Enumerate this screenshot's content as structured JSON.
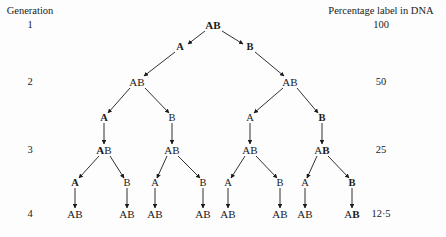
{
  "figure": {
    "background_color": "#fdfdfd",
    "ink_color": "#1a1a1a",
    "width": 446,
    "height": 237
  },
  "labels": {
    "generation_heading": "Generation",
    "percentage_heading": "Percentage label in DNA"
  },
  "generations": [
    {
      "number": "1",
      "percentage": "100"
    },
    {
      "number": "2",
      "percentage": "50"
    },
    {
      "number": "3",
      "percentage": "25"
    },
    {
      "number": "4",
      "percentage": "12·5"
    }
  ],
  "nodes": {
    "gen1": [
      {
        "id": "g1n1",
        "text": "AB",
        "bold_part": "AB",
        "plain_part": "",
        "x": 213,
        "y": 25
      }
    ],
    "gen2": [
      {
        "id": "g2n1",
        "text": "AB",
        "bold_part": "",
        "plain_part": "AB",
        "x": 137,
        "y": 82
      },
      {
        "id": "g2n2",
        "text": "AB",
        "bold_part": "",
        "plain_part": "AB",
        "x": 290,
        "y": 82
      }
    ],
    "gen3": [
      {
        "id": "g3n1",
        "text": "AB",
        "bold_part": "A",
        "plain_part": "B",
        "x": 104,
        "y": 150
      },
      {
        "id": "g3n2",
        "text": "AB",
        "bold_part": "",
        "plain_part": "AB",
        "x": 172,
        "y": 150
      },
      {
        "id": "g3n3",
        "text": "AB",
        "bold_part": "",
        "plain_part": "AB",
        "x": 250,
        "y": 150
      },
      {
        "id": "g3n4",
        "text": "AB",
        "bold_part": "B",
        "plain_part": "A",
        "x": 322,
        "y": 150
      }
    ],
    "gen4": [
      {
        "id": "g4n1",
        "text": "AB",
        "bold_part": "",
        "plain_part": "AB",
        "x": 75,
        "y": 214
      },
      {
        "id": "g4n2",
        "text": "AB",
        "bold_part": "",
        "plain_part": "AB",
        "x": 127,
        "y": 214
      },
      {
        "id": "g4n3",
        "text": "AB",
        "bold_part": "",
        "plain_part": "AB",
        "x": 155,
        "y": 214
      },
      {
        "id": "g4n4",
        "text": "AB",
        "bold_part": "",
        "plain_part": "AB",
        "x": 203,
        "y": 214
      },
      {
        "id": "g4n5",
        "text": "AB",
        "bold_part": "",
        "plain_part": "AB",
        "x": 228,
        "y": 214
      },
      {
        "id": "g4n6",
        "text": "AB",
        "bold_part": "",
        "plain_part": "AB",
        "x": 280,
        "y": 214
      },
      {
        "id": "g4n7",
        "text": "AB",
        "bold_part": "",
        "plain_part": "AB",
        "x": 305,
        "y": 214
      },
      {
        "id": "g4n8",
        "text": "AB",
        "bold_part": "B",
        "plain_part": "A",
        "x": 352,
        "y": 214
      }
    ]
  },
  "strand_letters": {
    "row1": [
      {
        "id": "s1a",
        "text": "A",
        "bold": true,
        "x": 180,
        "y": 47
      },
      {
        "id": "s1b",
        "text": "B",
        "bold": true,
        "x": 250,
        "y": 47
      }
    ],
    "row2": [
      {
        "id": "s2a",
        "text": "A",
        "bold": true,
        "x": 104,
        "y": 118
      },
      {
        "id": "s2b",
        "text": "B",
        "bold": false,
        "x": 172,
        "y": 118
      },
      {
        "id": "s2c",
        "text": "A",
        "bold": false,
        "x": 250,
        "y": 118
      },
      {
        "id": "s2d",
        "text": "B",
        "bold": true,
        "x": 322,
        "y": 118
      }
    ],
    "row3": [
      {
        "id": "s3a",
        "text": "A",
        "bold": true,
        "x": 75,
        "y": 183
      },
      {
        "id": "s3b",
        "text": "B",
        "bold": false,
        "x": 127,
        "y": 183
      },
      {
        "id": "s3c",
        "text": "A",
        "bold": false,
        "x": 155,
        "y": 183
      },
      {
        "id": "s3d",
        "text": "B",
        "bold": false,
        "x": 203,
        "y": 183
      },
      {
        "id": "s3e",
        "text": "A",
        "bold": false,
        "x": 228,
        "y": 183
      },
      {
        "id": "s3f",
        "text": "B",
        "bold": false,
        "x": 280,
        "y": 183
      },
      {
        "id": "s3g",
        "text": "A",
        "bold": false,
        "x": 305,
        "y": 183
      },
      {
        "id": "s3h",
        "text": "B",
        "bold": true,
        "x": 352,
        "y": 183
      }
    ]
  },
  "columns": {
    "generation_x": 30,
    "generation_heading_y": 11,
    "percentage_x": 381,
    "percentage_heading_y": 11,
    "generation_rows_y": [
      25,
      82,
      150,
      214
    ]
  },
  "edges": [
    {
      "from": "g1n1",
      "to": "s1a",
      "x1": 205,
      "y1": 31,
      "x2": 188,
      "y2": 44
    },
    {
      "from": "g1n1",
      "to": "s1b",
      "x1": 222,
      "y1": 31,
      "x2": 243,
      "y2": 44
    },
    {
      "from": "s1a",
      "to": "g2n1",
      "x1": 175,
      "y1": 52,
      "x2": 144,
      "y2": 76
    },
    {
      "from": "s1b",
      "to": "g2n2",
      "x1": 255,
      "y1": 52,
      "x2": 284,
      "y2": 76
    },
    {
      "from": "g2n1",
      "to": "s2a",
      "x1": 130,
      "y1": 88,
      "x2": 108,
      "y2": 113
    },
    {
      "from": "g2n1",
      "to": "s2b",
      "x1": 145,
      "y1": 88,
      "x2": 169,
      "y2": 113
    },
    {
      "from": "g2n2",
      "to": "s2c",
      "x1": 283,
      "y1": 88,
      "x2": 254,
      "y2": 113
    },
    {
      "from": "g2n2",
      "to": "s2d",
      "x1": 297,
      "y1": 88,
      "x2": 318,
      "y2": 113
    },
    {
      "from": "s2a",
      "to": "g3n1",
      "x1": 104,
      "y1": 123,
      "x2": 104,
      "y2": 144
    },
    {
      "from": "s2b",
      "to": "g3n2",
      "x1": 172,
      "y1": 123,
      "x2": 172,
      "y2": 144
    },
    {
      "from": "s2c",
      "to": "g3n3",
      "x1": 250,
      "y1": 123,
      "x2": 250,
      "y2": 144
    },
    {
      "from": "s2d",
      "to": "g3n4",
      "x1": 322,
      "y1": 123,
      "x2": 322,
      "y2": 144
    },
    {
      "from": "g3n1",
      "to": "s3a",
      "x1": 99,
      "y1": 156,
      "x2": 79,
      "y2": 178
    },
    {
      "from": "g3n1",
      "to": "s3b",
      "x1": 110,
      "y1": 156,
      "x2": 124,
      "y2": 178
    },
    {
      "from": "g3n2",
      "to": "s3c",
      "x1": 167,
      "y1": 156,
      "x2": 157,
      "y2": 178
    },
    {
      "from": "g3n2",
      "to": "s3d",
      "x1": 178,
      "y1": 156,
      "x2": 200,
      "y2": 178
    },
    {
      "from": "g3n3",
      "to": "s3e",
      "x1": 245,
      "y1": 156,
      "x2": 231,
      "y2": 178
    },
    {
      "from": "g3n3",
      "to": "s3f",
      "x1": 256,
      "y1": 156,
      "x2": 277,
      "y2": 178
    },
    {
      "from": "g3n4",
      "to": "s3g",
      "x1": 317,
      "y1": 156,
      "x2": 307,
      "y2": 178
    },
    {
      "from": "g3n4",
      "to": "s3h",
      "x1": 328,
      "y1": 156,
      "x2": 349,
      "y2": 178
    },
    {
      "from": "s3a",
      "to": "g4n1",
      "x1": 75,
      "y1": 188,
      "x2": 75,
      "y2": 208
    },
    {
      "from": "s3b",
      "to": "g4n2",
      "x1": 127,
      "y1": 188,
      "x2": 127,
      "y2": 208
    },
    {
      "from": "s3c",
      "to": "g4n3",
      "x1": 155,
      "y1": 188,
      "x2": 155,
      "y2": 208
    },
    {
      "from": "s3d",
      "to": "g4n4",
      "x1": 203,
      "y1": 188,
      "x2": 203,
      "y2": 208
    },
    {
      "from": "s3e",
      "to": "g4n5",
      "x1": 228,
      "y1": 188,
      "x2": 228,
      "y2": 208
    },
    {
      "from": "s3f",
      "to": "g4n6",
      "x1": 280,
      "y1": 188,
      "x2": 280,
      "y2": 208
    },
    {
      "from": "s3g",
      "to": "g4n7",
      "x1": 305,
      "y1": 188,
      "x2": 305,
      "y2": 208
    },
    {
      "from": "s3h",
      "to": "g4n8",
      "x1": 352,
      "y1": 188,
      "x2": 352,
      "y2": 208
    }
  ]
}
